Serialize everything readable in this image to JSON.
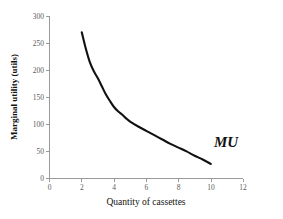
{
  "chart_data": {
    "type": "line",
    "title": "",
    "subtitle": "",
    "xlabel": "Quantity of cassettes",
    "ylabel": "Marginal utility (utils)",
    "xlim": [
      0,
      12
    ],
    "ylim": [
      0,
      300
    ],
    "xticks": [
      "0",
      "2",
      "4",
      "6",
      "8",
      "10",
      "12"
    ],
    "yticks": [
      "0",
      "50",
      "100",
      "150",
      "200",
      "250",
      "300"
    ],
    "grid": false,
    "legend_position": "inline-annotation",
    "series": [
      {
        "name": "MU",
        "label": "MU",
        "color": "#111111",
        "x": [
          2,
          2.25,
          2.5,
          2.75,
          3,
          3.25,
          3.5,
          3.75,
          4,
          4.25,
          4.5,
          4.75,
          5,
          5.5,
          6,
          6.5,
          7,
          7.5,
          8,
          8.5,
          9,
          9.5,
          10
        ],
        "values": [
          270,
          240,
          215,
          198,
          185,
          170,
          155,
          143,
          132,
          124,
          118,
          111,
          105,
          96,
          88,
          80,
          72,
          64,
          57,
          50,
          42,
          35,
          27
        ]
      }
    ],
    "annotations": [
      {
        "text": "MU",
        "x": 10.2,
        "y": 58
      }
    ]
  },
  "axis": {
    "x_title": "Quantity of cassettes",
    "y_title": "Marginal utility (utils)",
    "x_ticks": [
      "0",
      "2",
      "4",
      "6",
      "8",
      "10",
      "12"
    ],
    "y_ticks": [
      "0",
      "50",
      "100",
      "150",
      "200",
      "250",
      "300"
    ]
  },
  "colors": {
    "curve": "#111111",
    "axis": "#9a9a9a",
    "tick_text": "#5b5b5b",
    "background": "#ffffff"
  }
}
